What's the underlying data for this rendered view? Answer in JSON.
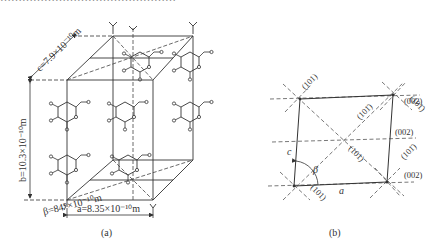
{
  "top_caption_fragment": "…………………………………………",
  "figure_a": {
    "caption": "(a)",
    "labels": {
      "c": "c=7.9×10⁻¹⁰m",
      "b": "b=10.3×10⁻¹⁰m",
      "beta": "β=84°×10⁻¹⁰m",
      "a": "a=8.35×10⁻¹⁰m"
    }
  },
  "figure_b": {
    "caption": "(b)",
    "axis_labels": {
      "a": "a",
      "c": "c",
      "beta": "β"
    },
    "planes": [
      "(101)",
      "(101̄)",
      "(101̄)",
      "(101)",
      "(101̄)",
      "(101)",
      "(002)",
      "(002)",
      "(002)"
    ]
  },
  "colors": {
    "line": "#333333",
    "dash": "#555555",
    "text": "#333333"
  }
}
